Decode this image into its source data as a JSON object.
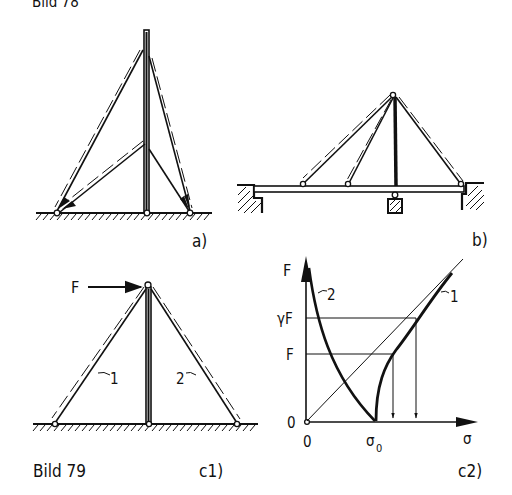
{
  "caption_top": "Bild 78",
  "caption_bottom": "Bild 79",
  "panels": {
    "a": {
      "label": "a)"
    },
    "b": {
      "label": "b)"
    },
    "c1": {
      "label": "c1)",
      "force_label": "F",
      "guy_labels": [
        "1",
        "2"
      ]
    },
    "c2": {
      "label": "c2)",
      "y_axis_label": "F",
      "x_axis_label": "σ",
      "y_ticks": [
        "γF",
        "F",
        "0"
      ],
      "x_ticks": [
        "0",
        "σ0"
      ],
      "x_tick_sigma": "σ",
      "x_tick_sub": "0",
      "curve_labels": [
        "1",
        "2"
      ]
    }
  }
}
